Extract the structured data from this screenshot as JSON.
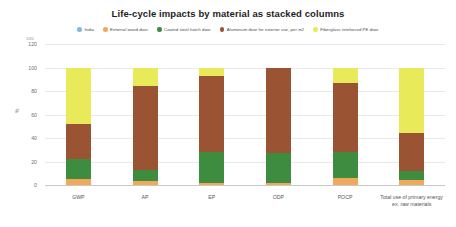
{
  "chart_data": {
    "type": "bar",
    "stacked": true,
    "title": "Life-cycle impacts by material as stacked columns",
    "xlabel": "",
    "ylabel": "%",
    "ylim": [
      0,
      120
    ],
    "yticks": [
      0,
      20,
      40,
      60,
      80,
      100,
      120
    ],
    "grid": true,
    "legend_position": "top",
    "categories": [
      "GWP",
      "AP",
      "EP",
      "ODP",
      "POCP",
      "Total use of primary energy ex. raw materials"
    ],
    "category_labels": [
      {
        "line1": "GWP",
        "line2": ""
      },
      {
        "line1": "AP",
        "line2": ""
      },
      {
        "line1": "EP",
        "line2": ""
      },
      {
        "line1": "ODP",
        "line2": ""
      },
      {
        "line1": "POCP",
        "line2": ""
      },
      {
        "line1": "Total use of primary energy",
        "line2": "ex. raw materials"
      }
    ],
    "series": [
      {
        "name": "India",
        "color": "#7fb9e0",
        "values": [
          0,
          0,
          0,
          0,
          0,
          0
        ]
      },
      {
        "name": "External wood door",
        "color": "#f0a95a",
        "values": [
          5,
          3,
          2,
          2,
          6,
          4
        ]
      },
      {
        "name": "Coated steel hatch door",
        "color": "#3d8c40",
        "values": [
          17,
          10,
          26,
          25,
          22,
          8
        ]
      },
      {
        "name": "Aluminium door for exterior use, per m2",
        "color": "#9a5434",
        "values": [
          30,
          71,
          65,
          73,
          59,
          32
        ]
      },
      {
        "name": "Fiberglass reinforced PE door",
        "color": "#e8ea5a",
        "values": [
          48,
          16,
          7,
          0,
          13,
          56
        ]
      }
    ],
    "totals": [
      100,
      100,
      100,
      100,
      100,
      100
    ]
  },
  "footer": {
    "page_number": "1/20"
  }
}
